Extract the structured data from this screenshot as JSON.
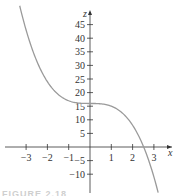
{
  "chart_data": {
    "type": "line",
    "title": "",
    "xlabel": "x",
    "ylabel": "z",
    "function": "z = 16 - x^3",
    "xlim": [
      -3.4,
      3.6
    ],
    "ylim": [
      -14,
      50
    ],
    "x_ticks": [
      -3,
      -2,
      -1,
      1,
      2,
      3
    ],
    "x_tick_labels": [
      "−3",
      "−2",
      "−1",
      "1",
      "2",
      "3"
    ],
    "y_ticks": [
      -10,
      -5,
      5,
      10,
      15,
      20,
      25,
      30,
      35,
      40,
      45
    ],
    "y_tick_labels": [
      "−10",
      "−5",
      "5",
      "10",
      "15",
      "20",
      "25",
      "30",
      "35",
      "40",
      "45"
    ],
    "grid": false,
    "legend": null,
    "series": [
      {
        "name": "z(x)",
        "color": "#9a9a9a",
        "x": [
          -3.3,
          -3,
          -2.5,
          -2,
          -1.5,
          -1,
          -0.5,
          0,
          0.5,
          1,
          1.5,
          2,
          2.5,
          2.52,
          3,
          3.2
        ],
        "values": [
          51.9,
          43,
          31.6,
          24,
          19.4,
          17,
          16.1,
          16,
          15.9,
          15,
          12.6,
          8,
          0.4,
          0,
          -11,
          -16.8
        ]
      }
    ],
    "annotations": []
  },
  "caption": {
    "text": "FIGURE 2.18"
  },
  "colors": {
    "axis": "#333333",
    "curve": "#9a9a9a",
    "background": "#ffffff"
  }
}
